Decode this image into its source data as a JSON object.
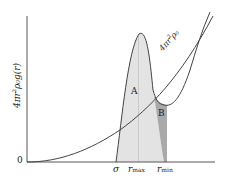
{
  "diagram": {
    "y_axis_label": "4πr²ρ₀g(r)",
    "y_axis_label_main": "4πr",
    "y_axis_label_sup": "2",
    "y_axis_label_rest": "ρ₀g(r)",
    "origin_label": "0",
    "curve_label_main": "4πr",
    "curve_label_sup": "2",
    "curve_label_rest": "ρ₀",
    "region_a_label": "A",
    "region_b_label": "B",
    "x_ticks": [
      {
        "label": "σ"
      },
      {
        "label": "r",
        "sub": "max"
      },
      {
        "label": "r",
        "sub": "min"
      }
    ],
    "colors": {
      "line": "#444444",
      "region_a_fill": "#e2e2e2",
      "region_b_fill": "#a8a8a8",
      "guide": "#b0b0b0"
    }
  }
}
